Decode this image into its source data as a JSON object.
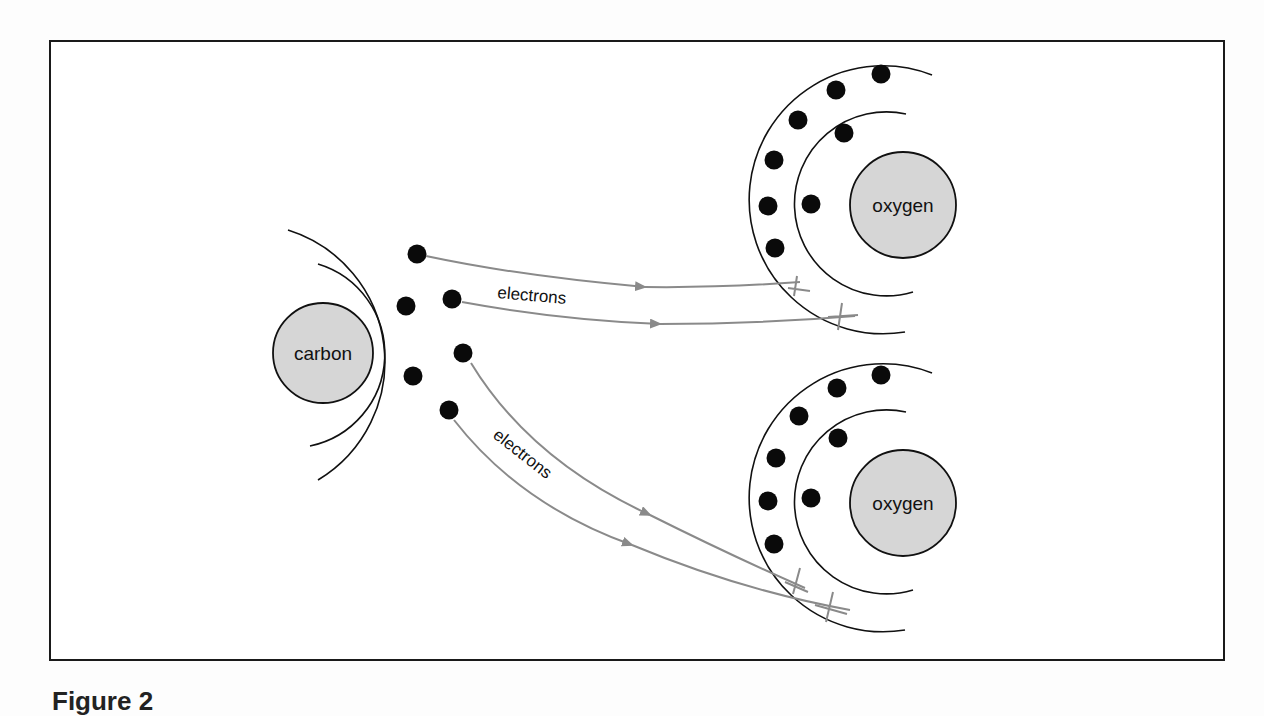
{
  "figure": {
    "caption": "Figure 2",
    "colors": {
      "frame": "#1a1a1a",
      "shell": "#111111",
      "electron": "#0a0a0a",
      "nucleus_fill": "#d6d6d6",
      "arrow": "#8a8a8a"
    }
  },
  "atoms": {
    "carbon": {
      "label": "carbon",
      "cx": 323,
      "cy": 353,
      "r": 50,
      "inner_shell_r": 94,
      "outer_shell_r": 138
    },
    "oxygen_top": {
      "label": "oxygen",
      "cx": 903,
      "cy": 205,
      "r": 53,
      "inner_shell_r": 92,
      "outer_shell_r": 134
    },
    "oxygen_bottom": {
      "label": "oxygen",
      "cx": 903,
      "cy": 503,
      "r": 53,
      "inner_shell_r": 92,
      "outer_shell_r": 134
    }
  },
  "arrows": {
    "top_label": "electrons",
    "bottom_label": "electrons"
  }
}
